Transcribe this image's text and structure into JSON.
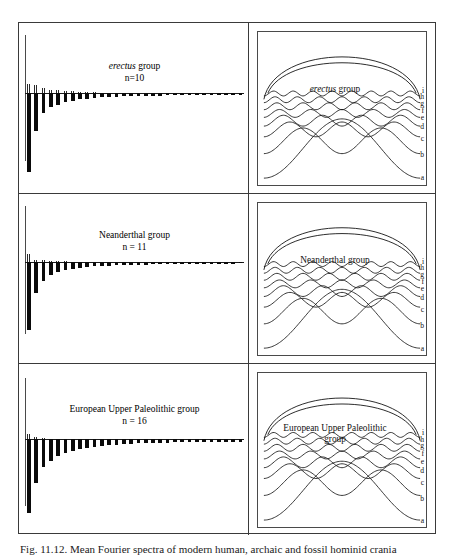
{
  "figure": {
    "caption": "Fig. 11.12. Mean Fourier spectra of modern human, archaic and fossil hominid crania",
    "panels": [
      {
        "id": "erectus",
        "spectrum_title_italic": "erectus",
        "spectrum_title_roman": " group",
        "sample_size_label": "n=10",
        "harmonics_title_italic": "erectus",
        "harmonics_title_roman": "  group",
        "harmonics_title_line2": "",
        "curve_labels": [
          "i",
          "h",
          "g",
          "f",
          "e",
          "d",
          "c",
          "b",
          "a"
        ]
      },
      {
        "id": "neanderthal",
        "spectrum_title_italic": "",
        "spectrum_title_roman": "Neanderthal group",
        "sample_size_label": "n = 11",
        "harmonics_title_italic": "",
        "harmonics_title_roman": "Neanderthal group",
        "harmonics_title_line2": "",
        "curve_labels": [
          "i",
          "h",
          "g",
          "f",
          "e",
          "d",
          "c",
          "b",
          "a"
        ]
      },
      {
        "id": "european-upper-paleolithic",
        "spectrum_title_italic": "",
        "spectrum_title_roman": "European Upper Paleolithic group",
        "sample_size_label": "n = 16",
        "harmonics_title_italic": "",
        "harmonics_title_roman": "European Upper Paleolithic",
        "harmonics_title_line2": "group",
        "curve_labels": [
          "i",
          "h",
          "g",
          "f",
          "e",
          "d",
          "c",
          "b",
          "a"
        ]
      }
    ]
  },
  "chart_data": [
    {
      "type": "bar",
      "title": "erectus group",
      "subtitle": "n=10",
      "xlabel": "Harmonic number",
      "ylabel": "Amplitude",
      "categories": [
        1,
        2,
        3,
        4,
        5,
        6,
        7,
        8,
        9,
        10,
        11,
        12,
        13,
        14,
        15,
        16,
        17,
        18,
        19,
        20,
        21,
        22,
        23,
        24,
        25,
        26,
        27,
        28,
        29,
        30
      ],
      "series": [
        {
          "name": "negative amplitude (below axis, solid black)",
          "values": [
            -62,
            -30,
            -16,
            -11,
            -9,
            -7,
            -6,
            -5,
            -4.5,
            -4,
            -3.5,
            -3,
            -3,
            -2.5,
            -2.5,
            -2,
            -2,
            -2,
            -2,
            -1.8,
            -1.8,
            -1.6,
            -1.6,
            -1.5,
            -1.5,
            -1.4,
            -1.4,
            -1.3,
            -1.3,
            -1.2
          ]
        },
        {
          "name": "positive amplitude (above axis, hatched)",
          "values": [
            8,
            7,
            4,
            3,
            2.5,
            2,
            1.5,
            1.2,
            1,
            0.9,
            0.8,
            0.7,
            0.7,
            0.6,
            0.6,
            0.5,
            0.5,
            0.5,
            0.4,
            0.4,
            0.4,
            0.4,
            0.3,
            0.3,
            0.3,
            0.3,
            0.3,
            0.3,
            0.3,
            0.3
          ]
        }
      ],
      "ylim": [
        -70,
        14
      ],
      "grid": false,
      "legend": "none"
    },
    {
      "type": "bar",
      "title": "Neanderthal group",
      "subtitle": "n = 11",
      "xlabel": "Harmonic number",
      "ylabel": "Amplitude",
      "categories": [
        1,
        2,
        3,
        4,
        5,
        6,
        7,
        8,
        9,
        10,
        11,
        12,
        13,
        14,
        15,
        16,
        17,
        18,
        19,
        20,
        21,
        22,
        23,
        24,
        25,
        26,
        27,
        28,
        29,
        30
      ],
      "series": [
        {
          "name": "negative amplitude (below axis, solid black)",
          "values": [
            -53,
            -24,
            -15,
            -10,
            -8,
            -6.5,
            -5.5,
            -4.5,
            -4,
            -3.5,
            -3,
            -3,
            -2.5,
            -2.5,
            -2,
            -2,
            -2,
            -1.8,
            -1.8,
            -1.6,
            -1.6,
            -1.5,
            -1.5,
            -1.4,
            -1.4,
            -1.3,
            -1.3,
            -1.2,
            -1.2,
            -1.1
          ]
        },
        {
          "name": "positive amplitude (above axis, hatched)",
          "values": [
            7,
            2,
            1.5,
            1.2,
            1,
            0.9,
            0.8,
            0.7,
            0.6,
            0.6,
            0.5,
            0.5,
            0.4,
            0.4,
            0.4,
            0.3,
            0.3,
            0.3,
            0.3,
            0.3,
            0.3,
            0.2,
            0.2,
            0.2,
            0.2,
            0.2,
            0.2,
            0.2,
            0.2,
            0.2
          ]
        }
      ],
      "ylim": [
        -70,
        14
      ],
      "grid": false,
      "legend": "none"
    },
    {
      "type": "bar",
      "title": "European Upper Paleolithic group",
      "subtitle": "n = 16",
      "xlabel": "Harmonic number",
      "ylabel": "Amplitude",
      "categories": [
        1,
        2,
        3,
        4,
        5,
        6,
        7,
        8,
        9,
        10,
        11,
        12,
        13,
        14,
        15,
        16,
        17,
        18,
        19,
        20,
        21,
        22,
        23,
        24,
        25,
        26,
        27,
        28,
        29,
        30
      ],
      "series": [
        {
          "name": "negative amplitude (below axis, solid black)",
          "values": [
            -58,
            -34,
            -22,
            -17,
            -13,
            -11,
            -9,
            -8,
            -7,
            -6,
            -5.5,
            -5,
            -4.5,
            -4,
            -4,
            -3.5,
            -3.5,
            -3,
            -3,
            -3,
            -2.5,
            -2.5,
            -2.5,
            -2.5,
            -2,
            -2,
            -2,
            -2,
            -2,
            -2
          ]
        },
        {
          "name": "positive amplitude (above axis, hatched)",
          "values": [
            4,
            1.5,
            1,
            0.8,
            0.6,
            0.5,
            0.5,
            0.4,
            0.4,
            0.3,
            0.3,
            0.3,
            0.3,
            0.3,
            0.2,
            0.2,
            0.2,
            0.2,
            0.2,
            0.2,
            0.2,
            0.2,
            0.2,
            0.2,
            0.2,
            0.2,
            0.2,
            0.2,
            0.2,
            0.2
          ]
        }
      ],
      "ylim": [
        -70,
        14
      ],
      "grid": false,
      "legend": "none"
    },
    {
      "type": "line",
      "title": "erectus group harmonic reconstructions",
      "xlabel": "",
      "ylabel": "",
      "series": [
        {
          "name": "a",
          "harmonic": 1,
          "amplitude": 1.0,
          "cycles": 1
        },
        {
          "name": "b",
          "harmonic": 2,
          "amplitude": 0.46,
          "cycles": 2
        },
        {
          "name": "c",
          "harmonic": 3,
          "amplitude": 0.26,
          "cycles": 3
        },
        {
          "name": "d",
          "harmonic": 4,
          "amplitude": 0.18,
          "cycles": 4
        },
        {
          "name": "e",
          "harmonic": 5,
          "amplitude": 0.12,
          "cycles": 5
        },
        {
          "name": "f",
          "harmonic": 6,
          "amplitude": 0.09,
          "cycles": 6
        },
        {
          "name": "g",
          "harmonic": 7,
          "amplitude": 0.07,
          "cycles": 7
        },
        {
          "name": "h",
          "harmonic": 8,
          "amplitude": 0.05,
          "cycles": 8
        },
        {
          "name": "i",
          "harmonic": 0,
          "amplitude": 1.0,
          "cycles": 0
        }
      ],
      "legend": "right"
    },
    {
      "type": "line",
      "title": "Neanderthal group harmonic reconstructions",
      "xlabel": "",
      "ylabel": "",
      "series": [
        {
          "name": "a",
          "harmonic": 1,
          "amplitude": 1.0,
          "cycles": 1
        },
        {
          "name": "b",
          "harmonic": 2,
          "amplitude": 0.44,
          "cycles": 2
        },
        {
          "name": "c",
          "harmonic": 3,
          "amplitude": 0.24,
          "cycles": 3
        },
        {
          "name": "d",
          "harmonic": 4,
          "amplitude": 0.17,
          "cycles": 4
        },
        {
          "name": "e",
          "harmonic": 5,
          "amplitude": 0.12,
          "cycles": 5
        },
        {
          "name": "f",
          "harmonic": 6,
          "amplitude": 0.09,
          "cycles": 6
        },
        {
          "name": "g",
          "harmonic": 7,
          "amplitude": 0.06,
          "cycles": 7
        },
        {
          "name": "h",
          "harmonic": 8,
          "amplitude": 0.04,
          "cycles": 8
        },
        {
          "name": "i",
          "harmonic": 0,
          "amplitude": 1.0,
          "cycles": 0
        }
      ],
      "legend": "right"
    },
    {
      "type": "line",
      "title": "European Upper Paleolithic group harmonic reconstructions",
      "xlabel": "",
      "ylabel": "",
      "series": [
        {
          "name": "a",
          "harmonic": 1,
          "amplitude": 1.0,
          "cycles": 1
        },
        {
          "name": "b",
          "harmonic": 2,
          "amplitude": 0.5,
          "cycles": 2
        },
        {
          "name": "c",
          "harmonic": 3,
          "amplitude": 0.3,
          "cycles": 3
        },
        {
          "name": "d",
          "harmonic": 4,
          "amplitude": 0.22,
          "cycles": 4
        },
        {
          "name": "e",
          "harmonic": 5,
          "amplitude": 0.16,
          "cycles": 5
        },
        {
          "name": "f",
          "harmonic": 6,
          "amplitude": 0.12,
          "cycles": 6
        },
        {
          "name": "g",
          "harmonic": 7,
          "amplitude": 0.09,
          "cycles": 7
        },
        {
          "name": "h",
          "harmonic": 8,
          "amplitude": 0.07,
          "cycles": 8
        },
        {
          "name": "i",
          "harmonic": 0,
          "amplitude": 1.0,
          "cycles": 0
        }
      ],
      "legend": "right"
    }
  ]
}
